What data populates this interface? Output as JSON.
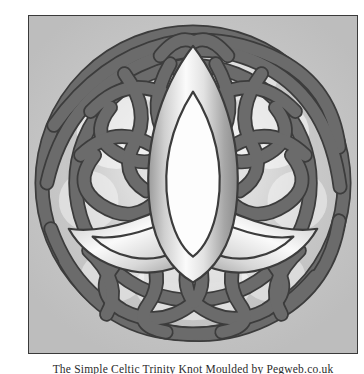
{
  "page": {
    "background_color": "#ffffff",
    "width": 364,
    "height": 374
  },
  "figure": {
    "name": "celtic-trinity-knot-plate",
    "frame": {
      "border_color": "#3a3a3a",
      "background_color": "#c9c9c9"
    },
    "artwork": {
      "title": "Celtic Trinity Knot",
      "alt_name": "triquetra-with-braided-border",
      "style": "grayscale embossed relief",
      "colors": {
        "plate_background": "#c9c9c9",
        "rope_fill": "#6a6a6a",
        "rope_outline": "#3c3c3c",
        "band_light": "#f4f4f4",
        "band_mid": "#b6b6b6",
        "band_shadow": "#8d8d8d",
        "leaf_interior": "#fdfdfd",
        "glow_highlight": "#ffffff"
      },
      "elements": [
        "outer-braided-ring",
        "central-triquetra",
        "vertical-leaf",
        "left-lobe",
        "right-lobe"
      ]
    }
  },
  "caption": {
    "text": "The Simple Celtic Trinity Knot Moulded by Pegweb.co.uk"
  }
}
